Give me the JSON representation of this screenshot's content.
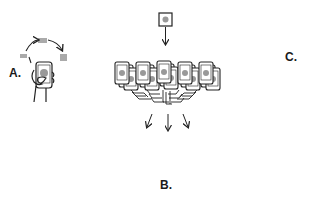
{
  "diagram": {
    "labels": {
      "a": "A.",
      "b": "B.",
      "c": "C."
    },
    "colors": {
      "stroke": "#222222",
      "dashed": "#bbbbbb",
      "gray_fill": "#aaaaaa",
      "dot_fill": "#999999",
      "background": "#ffffff"
    },
    "nodes": [
      {
        "id": "top-model",
        "description": "single model square with dot at top center"
      },
      {
        "id": "device-fleet",
        "description": "fan of stacked phones each showing a dot"
      },
      {
        "id": "phone-in-hand",
        "description": "hand holding a phone with cycling gray rectangles (A)"
      },
      {
        "id": "local-data-square",
        "description": "square with gray square, bottom left"
      },
      {
        "id": "aggregated-updates",
        "description": "five stacks of square cards with varied shapes (B)"
      },
      {
        "id": "cloud",
        "description": "cloud containing a diamond"
      },
      {
        "id": "updated-model",
        "description": "square with dot above cloud (C)"
      }
    ],
    "shapes_in_b": [
      "square",
      "diamond",
      "star",
      "diamond",
      "pill"
    ]
  }
}
